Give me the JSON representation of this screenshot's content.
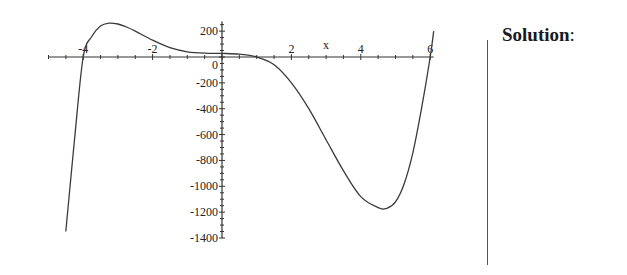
{
  "chart_data": {
    "type": "line",
    "title": "",
    "xlabel": "x",
    "ylabel": "",
    "xlim": [
      -5,
      6.1
    ],
    "ylim": [
      -1400,
      280
    ],
    "x_ticks": [
      -4,
      -2,
      0,
      2,
      4,
      6
    ],
    "x_tick_labels": [
      "-4",
      "-2",
      "0",
      "2",
      "4",
      "6"
    ],
    "y_ticks": [
      200,
      0,
      -200,
      -400,
      -600,
      -800,
      -1000,
      -1200,
      -1400
    ],
    "y_tick_labels": [
      "200",
      "0",
      "-200",
      "-400",
      "-600",
      "-800",
      "-1000",
      "-1200",
      "-1400"
    ],
    "grid": false,
    "legend": null,
    "series": [
      {
        "name": "f(x)",
        "x": [
          -4.5,
          -4.25,
          -4.0,
          -3.75,
          -3.5,
          -3.25,
          -3.0,
          -2.75,
          -2.5,
          -2.0,
          -1.5,
          -1.0,
          -0.5,
          0.0,
          0.5,
          1.0,
          1.5,
          2.0,
          2.5,
          3.0,
          3.5,
          4.0,
          4.5,
          4.75,
          5.0,
          5.25,
          5.5,
          5.75,
          6.0,
          6.1
        ],
        "values": [
          -1350,
          -640,
          0,
          160,
          240,
          262,
          255,
          232,
          200,
          130,
          72,
          40,
          30,
          28,
          22,
          0,
          -60,
          -200,
          -400,
          -640,
          -880,
          -1080,
          -1165,
          -1170,
          -1120,
          -980,
          -740,
          -400,
          0,
          200
        ]
      }
    ],
    "annotations": [
      {
        "text": "x",
        "position": "above x-axis between 2 and 4"
      }
    ]
  },
  "panel": {
    "solution_label": "Solution",
    "solution_colon": ":"
  }
}
